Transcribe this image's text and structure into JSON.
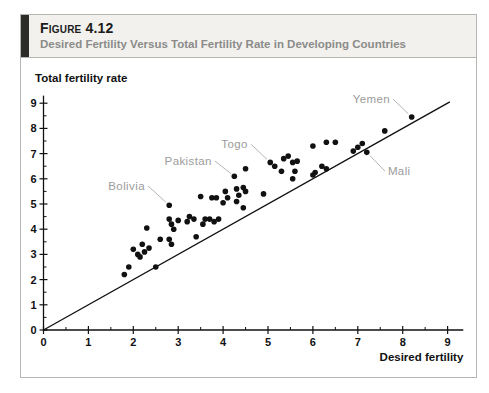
{
  "figure": {
    "label": "Figure 4.12",
    "title": "Desired Fertility Versus Total Fertility Rate in Developing Countries"
  },
  "colors": {
    "header_background": "#f2f1ee",
    "accent_bar": "#2e2c2a",
    "box_border": "#b5b5b2",
    "subtitle_gray": "#8b8b89"
  },
  "chart_data": {
    "type": "scatter",
    "title": "",
    "xlabel": "Desired fertility",
    "ylabel": "Total fertility rate",
    "xlim": [
      0,
      9.35
    ],
    "ylim": [
      0,
      9.3
    ],
    "xticks": [
      0,
      1,
      2,
      3,
      4,
      5,
      6,
      7,
      8,
      9
    ],
    "yticks": [
      0,
      1,
      2,
      3,
      4,
      5,
      6,
      7,
      8,
      9
    ],
    "minor_tick_step": 0.5,
    "grid": false,
    "point_color": "#111111",
    "axis_color": "#111111",
    "tick_label_color": "#111111",
    "country_label_color": "#9b9b9b",
    "leader_line_color": "#b5b5b5",
    "reference_line": {
      "from": [
        0,
        0
      ],
      "to": [
        9.05,
        9.05
      ],
      "description": "45-degree line where total fertility equals desired fertility"
    },
    "points": [
      [
        1.8,
        2.2
      ],
      [
        1.9,
        2.5
      ],
      [
        2.0,
        3.2
      ],
      [
        2.1,
        3.0
      ],
      [
        2.15,
        2.9
      ],
      [
        2.2,
        3.4
      ],
      [
        2.25,
        3.1
      ],
      [
        2.35,
        3.25
      ],
      [
        2.5,
        2.5
      ],
      [
        2.3,
        4.05
      ],
      [
        2.6,
        3.6
      ],
      [
        2.8,
        3.6
      ],
      [
        2.85,
        3.4
      ],
      [
        2.8,
        4.95
      ],
      [
        2.8,
        4.4
      ],
      [
        2.85,
        4.2
      ],
      [
        2.9,
        4.0
      ],
      [
        3.0,
        4.35
      ],
      [
        3.2,
        4.3
      ],
      [
        3.25,
        4.5
      ],
      [
        3.35,
        4.4
      ],
      [
        3.4,
        3.7
      ],
      [
        3.5,
        5.3
      ],
      [
        3.75,
        5.25
      ],
      [
        3.85,
        5.25
      ],
      [
        3.6,
        4.4
      ],
      [
        3.55,
        4.2
      ],
      [
        3.7,
        4.4
      ],
      [
        3.8,
        4.3
      ],
      [
        3.9,
        4.4
      ],
      [
        4.0,
        5.05
      ],
      [
        4.05,
        5.5
      ],
      [
        4.1,
        5.25
      ],
      [
        4.3,
        5.6
      ],
      [
        4.3,
        5.1
      ],
      [
        4.35,
        5.35
      ],
      [
        4.25,
        6.1
      ],
      [
        4.45,
        5.65
      ],
      [
        4.5,
        5.5
      ],
      [
        4.45,
        4.85
      ],
      [
        4.5,
        6.4
      ],
      [
        4.9,
        5.4
      ],
      [
        5.05,
        6.65
      ],
      [
        5.15,
        6.5
      ],
      [
        5.35,
        6.8
      ],
      [
        5.45,
        6.9
      ],
      [
        5.55,
        6.65
      ],
      [
        5.65,
        6.7
      ],
      [
        5.3,
        6.3
      ],
      [
        5.6,
        6.3
      ],
      [
        5.55,
        6.0
      ],
      [
        6.0,
        6.15
      ],
      [
        6.05,
        6.25
      ],
      [
        6.2,
        6.5
      ],
      [
        6.3,
        6.4
      ],
      [
        6.0,
        7.3
      ],
      [
        6.3,
        7.45
      ],
      [
        6.5,
        7.45
      ],
      [
        6.9,
        7.1
      ],
      [
        7.0,
        7.25
      ],
      [
        7.1,
        7.4
      ],
      [
        7.2,
        7.05
      ],
      [
        7.6,
        7.9
      ],
      [
        8.2,
        8.45
      ]
    ],
    "labeled_points": [
      {
        "name": "Bolivia",
        "x": 2.8,
        "y": 4.95,
        "label_x": 2.26,
        "label_y": 5.56,
        "anchor": "end"
      },
      {
        "name": "Pakistan",
        "x": 4.25,
        "y": 6.1,
        "label_x": 3.75,
        "label_y": 6.55,
        "anchor": "end"
      },
      {
        "name": "Togo",
        "x": 5.05,
        "y": 6.65,
        "label_x": 4.55,
        "label_y": 7.22,
        "anchor": "end"
      },
      {
        "name": "Yemen",
        "x": 8.2,
        "y": 8.45,
        "label_x": 7.72,
        "label_y": 9.0,
        "anchor": "end"
      },
      {
        "name": "Mali",
        "x": 7.2,
        "y": 7.05,
        "label_x": 7.67,
        "label_y": 6.15,
        "anchor": "start"
      }
    ]
  }
}
